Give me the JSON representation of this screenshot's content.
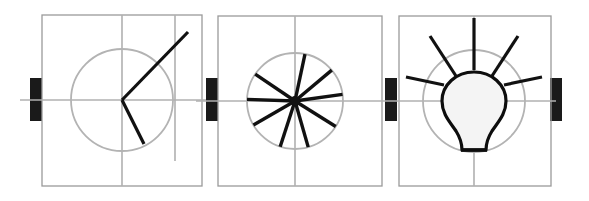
{
  "canvas": {
    "width": 589,
    "height": 201,
    "background": "#ffffff",
    "title": "Filmstrip of three animation keyframes: angle, starburst, lightbulb"
  },
  "colors": {
    "background": "#ffffff",
    "frame_border": "#9a9a9a",
    "guide_line": "#b0b0b0",
    "guide_circle": "#b3b3b3",
    "stroke_dark": "#111111",
    "connector_tab": "#1a1a1a",
    "bulb_fill": "#f4f4f4",
    "bulb_stroke": "#0d0d0d"
  },
  "strip": {
    "panel_count": 3,
    "connector_tab_count": 4,
    "connector_tabs": [
      {
        "name": "connector-tab-1",
        "x": 30,
        "y": 78,
        "width": 12,
        "height": 43
      },
      {
        "name": "connector-tab-2",
        "x": 206,
        "y": 78,
        "width": 12,
        "height": 43
      },
      {
        "name": "connector-tab-3",
        "x": 385,
        "y": 78,
        "width": 12,
        "height": 43
      },
      {
        "name": "connector-tab-4",
        "x": 550,
        "y": 78,
        "width": 12,
        "height": 43
      }
    ]
  },
  "panels": [
    {
      "id": "panel-1",
      "label": "angle-keyframe",
      "frame": {
        "x": 42,
        "y": 15,
        "width": 160,
        "height": 171
      },
      "center": {
        "x": 122,
        "y": 100
      },
      "guide_circle": {
        "cx": 122,
        "cy": 100,
        "r": 51
      },
      "guides": [
        {
          "name": "horizontal-center-guide",
          "x1": 20,
          "y1": 100,
          "x2": 206,
          "y2": 100
        },
        {
          "name": "vertical-center-guide",
          "x1": 122,
          "y1": 15,
          "x2": 122,
          "y2": 186
        },
        {
          "name": "vertical-offset-guide",
          "x1": 175,
          "y1": 15,
          "x2": 175,
          "y2": 161
        }
      ],
      "shapes": [
        {
          "name": "angle-ray-upper",
          "x1": 122,
          "y1": 100,
          "x2": 188,
          "y2": 32
        },
        {
          "name": "angle-ray-lower",
          "x1": 122,
          "y1": 100,
          "x2": 144,
          "y2": 144
        }
      ]
    },
    {
      "id": "panel-2",
      "label": "starburst-keyframe",
      "frame": {
        "x": 218,
        "y": 16,
        "width": 164,
        "height": 170
      },
      "center": {
        "x": 295,
        "y": 101
      },
      "guide_circle": {
        "cx": 295,
        "cy": 101,
        "r": 48
      },
      "guides": [
        {
          "name": "horizontal-center-guide",
          "x1": 196,
          "y1": 101,
          "x2": 386,
          "y2": 101
        },
        {
          "name": "vertical-center-guide",
          "x1": 295,
          "y1": 16,
          "x2": 295,
          "y2": 186
        }
      ],
      "spoke_count": 9,
      "spokes": [
        {
          "name": "spoke-1",
          "angle_deg": -78,
          "length": 48
        },
        {
          "name": "spoke-2",
          "angle_deg": -40,
          "length": 48
        },
        {
          "name": "spoke-3",
          "angle_deg": -8,
          "length": 48
        },
        {
          "name": "spoke-4",
          "angle_deg": 32,
          "length": 48
        },
        {
          "name": "spoke-5",
          "angle_deg": 74,
          "length": 48
        },
        {
          "name": "spoke-6",
          "angle_deg": 108,
          "length": 48
        },
        {
          "name": "spoke-7",
          "angle_deg": 150,
          "length": 48
        },
        {
          "name": "spoke-8",
          "angle_deg": 182,
          "length": 48
        },
        {
          "name": "spoke-9",
          "angle_deg": 214,
          "length": 48
        }
      ]
    },
    {
      "id": "panel-3",
      "label": "lightbulb-keyframe",
      "frame": {
        "x": 399,
        "y": 16,
        "width": 152,
        "height": 170
      },
      "center": {
        "x": 474,
        "y": 101
      },
      "guide_circle": {
        "cx": 474,
        "cy": 101,
        "r": 51
      },
      "guides": [
        {
          "name": "horizontal-center-guide",
          "x1": 386,
          "y1": 101,
          "x2": 556,
          "y2": 101
        },
        {
          "name": "vertical-center-guide",
          "x1": 474,
          "y1": 16,
          "x2": 474,
          "y2": 186
        }
      ],
      "bulb": {
        "name": "lightbulb-glass",
        "path": "M 474 72 C 492 72 506 85 506 101 C 506 114 498 122 492 131 C 487 139 486 144 486 150 L 462 150 C 462 144 461 139 456 131 C 450 122 442 114 442 101 C 442 85 456 72 474 72 Z",
        "base": {
          "x1": 461,
          "y1": 150,
          "x2": 487,
          "y2": 150
        }
      },
      "ray_count": 5,
      "rays": [
        {
          "name": "ray-left-horizontal",
          "x1": 406,
          "y1": 77,
          "x2": 444,
          "y2": 85
        },
        {
          "name": "ray-upper-left",
          "x1": 430,
          "y1": 36,
          "x2": 456,
          "y2": 76
        },
        {
          "name": "ray-vertical-top",
          "x1": 474,
          "y1": 18,
          "x2": 474,
          "y2": 70
        },
        {
          "name": "ray-upper-right",
          "x1": 518,
          "y1": 36,
          "x2": 492,
          "y2": 76
        },
        {
          "name": "ray-right-horizontal",
          "x1": 542,
          "y1": 77,
          "x2": 504,
          "y2": 85
        }
      ]
    }
  ]
}
